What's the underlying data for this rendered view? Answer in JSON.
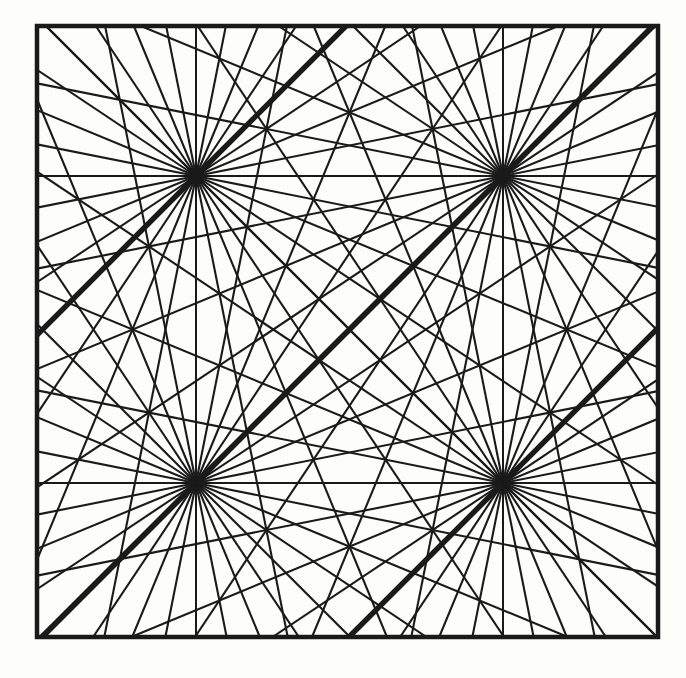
{
  "figure": {
    "type": "line-art-geometric",
    "canvas": {
      "width": 686,
      "height": 678,
      "background": "#fdfdfc"
    },
    "ink_color": "#1a1a1a",
    "frame": {
      "name": "outer-square-border",
      "x": 37,
      "y": 26,
      "width": 621,
      "height": 611,
      "stroke_width": 4.5,
      "fill": "none"
    },
    "burst": {
      "ray_count": 32,
      "angle_step_deg": 11.25,
      "start_angle_deg": 0,
      "thin_stroke_width": 2.1,
      "thick_stroke_width": 5.4,
      "thick_ray_angles_deg": [
        45,
        225
      ],
      "axis_stroke_width": 1.9,
      "axis_ray_angles_deg": [
        0,
        90,
        180,
        270
      ],
      "centers": [
        {
          "name": "burst-top-left",
          "cx": 196,
          "cy": 176
        },
        {
          "name": "burst-top-right",
          "cx": 503,
          "cy": 176
        },
        {
          "name": "burst-bottom-left",
          "cx": 196,
          "cy": 483
        },
        {
          "name": "burst-bottom-right",
          "cx": 503,
          "cy": 483
        }
      ]
    },
    "grid_lines": {
      "horizontal_y": [
        176,
        483
      ],
      "vertical_x": [
        196,
        503
      ]
    },
    "caption": ""
  }
}
